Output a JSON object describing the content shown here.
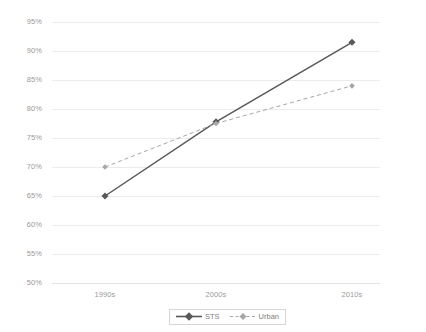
{
  "chart_data": {
    "type": "line",
    "title": "",
    "xlabel": "",
    "ylabel": "Republican vote",
    "categories": [
      "1990s",
      "2000s",
      "2010s"
    ],
    "ylim": [
      50,
      95
    ],
    "ytick_labels": [
      "95%",
      "90%",
      "85%",
      "80%",
      "75%",
      "70%",
      "65%",
      "60%",
      "55%",
      "50%"
    ],
    "ytick_values": [
      95,
      90,
      85,
      80,
      75,
      70,
      65,
      60,
      55,
      50
    ],
    "grid": true,
    "legend_position": "bottom",
    "series": [
      {
        "name": "STS",
        "values": [
          65.0,
          77.8,
          91.5
        ],
        "color": "#595959",
        "linestyle": "solid",
        "marker": "diamond"
      },
      {
        "name": "Urban",
        "values": [
          70.0,
          77.5,
          84.0
        ],
        "color": "#a6a6a6",
        "linestyle": "dashed",
        "marker": "diamond"
      }
    ]
  },
  "legend": {
    "items": [
      {
        "label": "STS"
      },
      {
        "label": "Urban"
      }
    ]
  },
  "colors": {
    "sts": "#595959",
    "urban": "#a6a6a6",
    "grid": "#ececec",
    "text": "#9a9a9a",
    "background": "#ffffff"
  }
}
